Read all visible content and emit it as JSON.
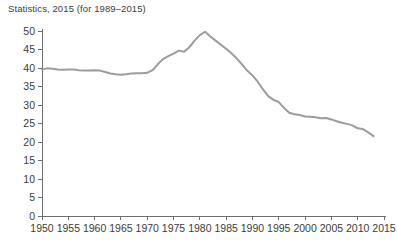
{
  "figure": {
    "caption": "Statistics, 2015 (for 1989–2015)",
    "background_color": "#ffffff",
    "axis_color": "#6e6e6e",
    "text_color": "#3c3c3c"
  },
  "chart_data": {
    "type": "line",
    "title": "Statistics, 2015 (for 1989–2015)",
    "xlabel": "",
    "ylabel": "",
    "xlim": [
      1950,
      2015
    ],
    "ylim": [
      0,
      50
    ],
    "grid": false,
    "legend": null,
    "line_color": "#9c9c9c",
    "line_width": 2,
    "xticks": [
      1950,
      1955,
      1960,
      1965,
      1970,
      1975,
      1980,
      1985,
      1990,
      1995,
      2000,
      2005,
      2010,
      2015
    ],
    "xtick_labels": [
      "1950",
      "1955",
      "1960",
      "1965",
      "1970",
      "1975",
      "1980",
      "1985",
      "1990",
      "1995",
      "2000",
      "2005",
      "2010",
      "2015"
    ],
    "yticks": [
      0,
      5,
      10,
      15,
      20,
      25,
      30,
      35,
      40,
      45,
      50
    ],
    "ytick_labels": [
      "0",
      "5",
      "10",
      "15",
      "20",
      "25",
      "30",
      "35",
      "40",
      "45",
      "50"
    ],
    "series": [
      {
        "name": "rate",
        "x": [
          1950,
          1951,
          1952,
          1953,
          1954,
          1955,
          1956,
          1957,
          1958,
          1959,
          1960,
          1961,
          1962,
          1963,
          1964,
          1965,
          1966,
          1967,
          1968,
          1969,
          1970,
          1971,
          1972,
          1973,
          1974,
          1975,
          1976,
          1977,
          1978,
          1979,
          1980,
          1981,
          1982,
          1983,
          1984,
          1985,
          1986,
          1987,
          1988,
          1989,
          1990,
          1991,
          1992,
          1993,
          1994,
          1995,
          1996,
          1997,
          1998,
          1999,
          2000,
          2001,
          2002,
          2003,
          2004,
          2005,
          2006,
          2007,
          2008,
          2009,
          2010,
          2011,
          2012,
          2013
        ],
        "y": [
          39.6,
          39.9,
          39.8,
          39.6,
          39.5,
          39.6,
          39.6,
          39.4,
          39.3,
          39.3,
          39.4,
          39.3,
          38.9,
          38.5,
          38.3,
          38.2,
          38.3,
          38.5,
          38.6,
          38.6,
          38.7,
          39.4,
          41.0,
          42.4,
          43.2,
          43.9,
          44.7,
          44.4,
          45.6,
          47.4,
          48.9,
          49.8,
          48.5,
          47.4,
          46.3,
          45.2,
          44.0,
          42.6,
          41.0,
          39.3,
          38.0,
          36.3,
          34.2,
          32.4,
          31.4,
          30.8,
          29.2,
          27.9,
          27.5,
          27.3,
          26.9,
          26.8,
          26.7,
          26.4,
          26.5,
          26.1,
          25.6,
          25.2,
          24.9,
          24.5,
          23.7,
          23.5,
          22.6,
          21.6
        ]
      }
    ]
  },
  "plot_geometry": {
    "left": 42,
    "right": 384,
    "top": 31,
    "bottom": 216
  }
}
